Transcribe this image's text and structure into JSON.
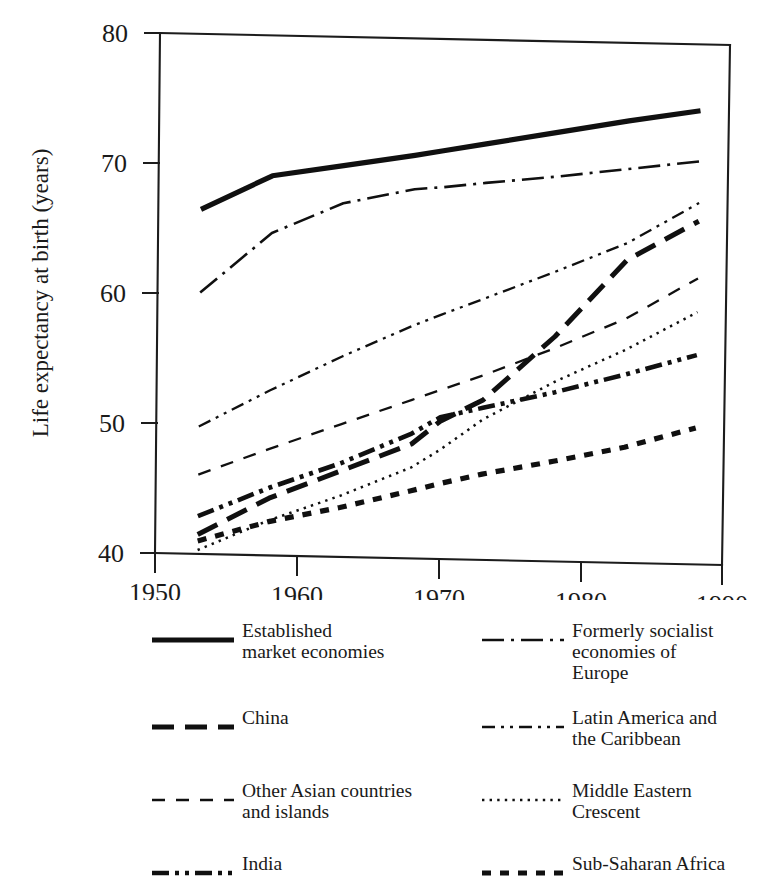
{
  "chart_data": {
    "type": "line",
    "title": "",
    "subtitle": "",
    "xlabel": "",
    "ylabel": "Life expectancy at birth (years)",
    "xlim": [
      1950,
      1990
    ],
    "ylim": [
      40,
      80
    ],
    "xticks": [
      "1950",
      "1960",
      "1970",
      "1980",
      "1990"
    ],
    "yticks": [
      "40",
      "50",
      "60",
      "70",
      "80"
    ],
    "grid": false,
    "legend_position": "below-chart-two-columns",
    "x": [
      1953,
      1958,
      1963,
      1968,
      1970,
      1973,
      1978,
      1983,
      1988
    ],
    "series": [
      {
        "name": "Established market economies",
        "label": "Established\nmarket economies",
        "style": "solid",
        "values": [
          66.5,
          69.2,
          70.1,
          71.0,
          71.4,
          72.0,
          73.0,
          74.0,
          74.9
        ]
      },
      {
        "name": "Formerly socialist economies of Europe",
        "label": "Formerly socialist\neconomies of\nEurope",
        "style": "dash-dot",
        "values": [
          60.1,
          64.8,
          67.2,
          68.4,
          68.6,
          69.0,
          69.6,
          70.3,
          71.0
        ]
      },
      {
        "name": "China",
        "label": "China",
        "style": "long-dash",
        "values": [
          41.5,
          44.4,
          46.6,
          48.8,
          50.6,
          52.3,
          57.3,
          63.3,
          66.4
        ]
      },
      {
        "name": "Latin America and the Caribbean",
        "label": "Latin America and\nthe Caribbean",
        "style": "dash-dot-dot-thin",
        "values": [
          49.8,
          52.7,
          55.4,
          57.9,
          58.8,
          60.1,
          62.3,
          64.6,
          67.8
        ]
      },
      {
        "name": "Other Asian countries and islands",
        "label": "Other Asian countries\nand islands",
        "style": "dashed-thin",
        "values": [
          46.1,
          48.2,
          50.2,
          52.2,
          53.0,
          54.2,
          56.4,
          58.8,
          62.0
        ]
      },
      {
        "name": "Middle Eastern Crescent",
        "label": "Middle Eastern\nCrescent",
        "style": "dotted",
        "values": [
          40.3,
          42.7,
          44.7,
          47.0,
          48.4,
          50.8,
          53.8,
          56.4,
          59.4
        ]
      },
      {
        "name": "India",
        "label": "India",
        "style": "dash-dot-dot-thick",
        "values": [
          42.9,
          45.2,
          47.2,
          49.6,
          50.9,
          51.7,
          53.0,
          54.5,
          56.1
        ]
      },
      {
        "name": "Sub-Saharan Africa",
        "label": "Sub-Saharan Africa",
        "style": "thick-dotted",
        "values": [
          41.0,
          42.6,
          43.8,
          45.2,
          45.8,
          46.6,
          47.7,
          48.9,
          50.5
        ]
      }
    ]
  },
  "axes": {
    "y_title": "Life expectancy at birth (years)",
    "y_tick_labels": [
      "80",
      "70",
      "60",
      "50",
      "40"
    ],
    "x_tick_labels": [
      "1950",
      "1960",
      "1970",
      "1980",
      "1990"
    ]
  },
  "legend": {
    "left_column": [
      {
        "id": "established-market-economies",
        "label": "Established\nmarket economies",
        "style": "solid"
      },
      {
        "id": "china",
        "label": "China",
        "style": "long-dash"
      },
      {
        "id": "other-asian-countries-and-islands",
        "label": "Other Asian countries\nand islands",
        "style": "dashed-thin"
      },
      {
        "id": "india",
        "label": "India",
        "style": "dash-dot-dot-thick"
      }
    ],
    "right_column": [
      {
        "id": "formerly-socialist-economies-of-europe",
        "label": "Formerly socialist\neconomies of\nEurope",
        "style": "dash-dot"
      },
      {
        "id": "latin-america-and-the-caribbean",
        "label": "Latin America and\nthe Caribbean",
        "style": "dash-dot-dot-thin"
      },
      {
        "id": "middle-eastern-crescent",
        "label": "Middle Eastern\nCrescent",
        "style": "dotted"
      },
      {
        "id": "sub-saharan-africa",
        "label": "Sub-Saharan Africa",
        "style": "thick-dotted"
      }
    ]
  },
  "colors": {
    "ink": "#101010",
    "axis": "#1c1c1c",
    "background": "#ffffff"
  }
}
